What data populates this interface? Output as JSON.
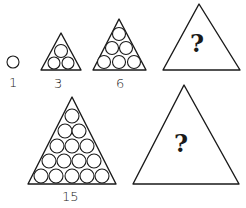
{
  "figure": {
    "items": [
      {
        "label": "1",
        "count": 1,
        "shape": "single circle"
      },
      {
        "label": "3",
        "count": 3,
        "shape": "triangle of circles, 2 rows"
      },
      {
        "label": "6",
        "count": 6,
        "shape": "triangle of circles, 3 rows"
      },
      {
        "label": "?",
        "count": null,
        "shape": "empty triangle with question mark"
      },
      {
        "label": "15",
        "count": 15,
        "shape": "triangle of circles, 5 rows"
      },
      {
        "label": "?",
        "count": null,
        "shape": "empty triangle with question mark"
      }
    ],
    "labels": {
      "one": "1",
      "three": "3",
      "six": "6",
      "fifteen": "15",
      "unknown_top": "?",
      "unknown_bottom": "?"
    },
    "colors": {
      "ink": "#1a1a1a",
      "background": "#ffffff"
    }
  }
}
